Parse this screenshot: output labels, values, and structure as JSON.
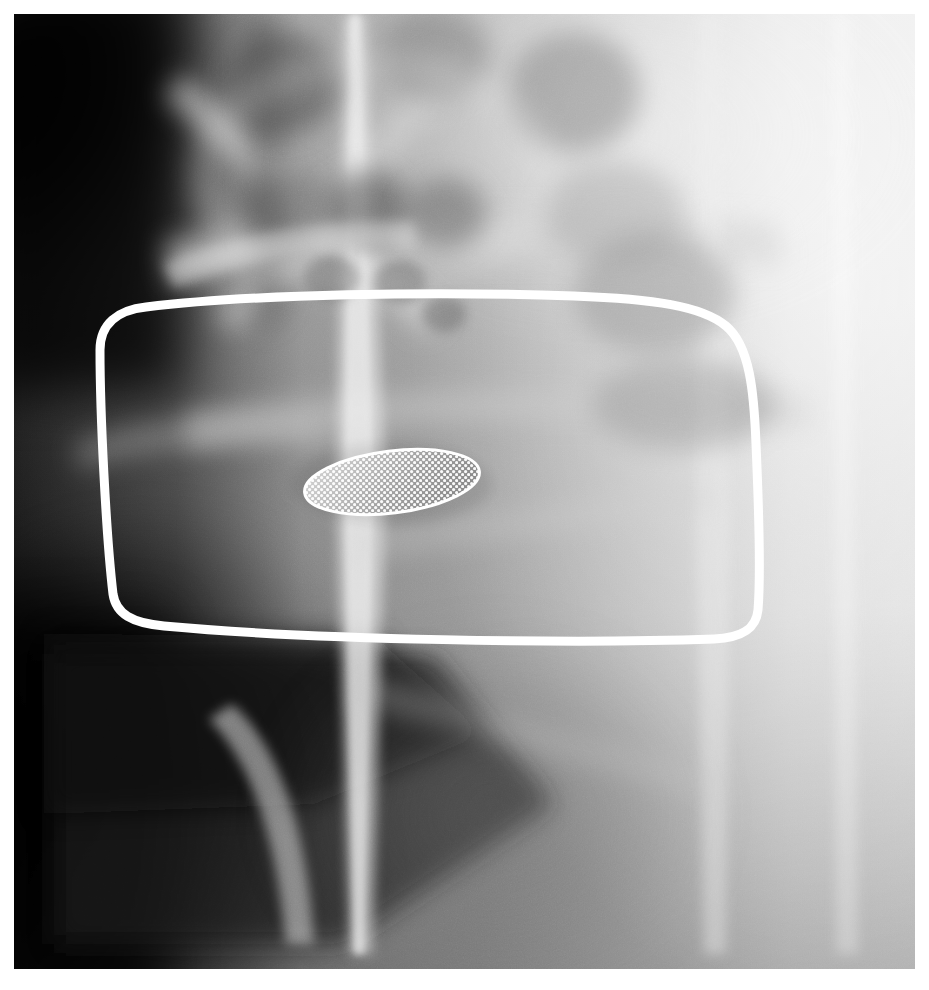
{
  "image": {
    "kind": "radiograph",
    "modality_appearance": "grayscale medical x-ray / tomographic slice",
    "region_description": "maxillofacial / cervical tomographic slice",
    "width": 929,
    "height": 990,
    "film": {
      "x": 14,
      "y": 14,
      "width": 901,
      "height": 955
    },
    "page_background": "#ffffff",
    "film_base_tone": "#9a9a9a"
  },
  "tones": {
    "black": "#050505",
    "very_dark": "#141414",
    "dark": "#353535",
    "mid_dark": "#5e5e5e",
    "mid": "#868686",
    "mid_light": "#a8a8a8",
    "light": "#c6c6c6",
    "very_light": "#e2e2e2",
    "near_white": "#f2f2f2",
    "white": "#ffffff"
  },
  "annotations": {
    "roi_outline": {
      "shape": "rounded-trapezoid",
      "stroke_color": "#ffffff",
      "stroke_width": 9,
      "label": "region-of-interest outline",
      "path": "M 86 336 C 86 310 104 296 132 293 C 240 280 420 277 560 282 C 640 285 688 292 712 312 C 736 332 740 378 742 430 C 745 498 747 560 744 596 C 742 616 726 624 700 625 C 560 630 300 626 150 612 C 118 609 102 600 99 580 C 92 520 86 400 86 336 Z"
    },
    "roi_ellipse": {
      "shape": "stippled-ellipse",
      "label": "lesion marker (stippled ellipse)",
      "center_x": 392,
      "center_y": 482,
      "radius_x": 88,
      "radius_y": 31,
      "rotation_deg": -7,
      "outline_color": "#ffffff",
      "outline_width": 3,
      "stipple_color": "#ffffff",
      "stipple_spacing": 6,
      "stipple_dot_radius": 1.6
    }
  },
  "anatomy_features": [
    {
      "name": "dark-air-space-upper-left",
      "tone": "#0a0a0a"
    },
    {
      "name": "dark-air-space-lower-left",
      "tone": "#191919"
    },
    {
      "name": "bright-vertical-streak-center",
      "tone": "#e8e8e8"
    },
    {
      "name": "bright-oblique-band-upper",
      "tone": "#dcdcdc"
    },
    {
      "name": "trabecular-bone-cluster-center",
      "tone": "#787878"
    },
    {
      "name": "radiolucent-cavity-left",
      "tone": "#6a6a6a"
    },
    {
      "name": "radiolucent-cavity-right",
      "tone": "#6f6f6f"
    },
    {
      "name": "bright-soft-tissue-right-field",
      "tone": "#ededed"
    },
    {
      "name": "cortical-plate-horizontal-band",
      "tone": "#cfcfcf"
    },
    {
      "name": "mandibular-border-lower-left",
      "tone": "#bdbdbd"
    }
  ]
}
